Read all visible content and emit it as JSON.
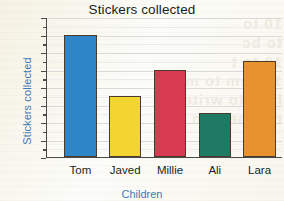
{
  "chart_data": {
    "type": "bar",
    "title": "Stickers collected",
    "xlabel": "Children",
    "ylabel": "Stickers collected",
    "categories": [
      "Tom",
      "Javed",
      "Millie",
      "Ali",
      "Lara"
    ],
    "values": [
      70,
      35,
      50,
      25,
      55
    ],
    "bar_colors": [
      "#2E86C8",
      "#F2D530",
      "#D63B52",
      "#1F7A63",
      "#E8922E"
    ],
    "ylim": [
      0,
      80
    ],
    "ytick_step": 10,
    "yminor_step": 5,
    "yticks": [
      0,
      10,
      20,
      30,
      40,
      50,
      60,
      70,
      80
    ],
    "ytick_labels": [
      "0",
      "10",
      "20",
      "30",
      "40",
      "50",
      "60",
      "70",
      "80"
    ],
    "grid": true,
    "legend": false,
    "legend_position": "none",
    "series": [
      {
        "name": "Stickers collected",
        "values": [
          70,
          35,
          50,
          25,
          55
        ]
      }
    ]
  },
  "style": {
    "title_color": "#1d1d1b",
    "axis_label_color": "#3f78b5",
    "tick_label_color": "#1d1d1b",
    "axis_line_color": "#4a4a4a",
    "gridline_color": "#d9d9d9",
    "bar_outline_color": "#4b3b2a",
    "background_color": "#fbfbf7"
  },
  "background_bleed_text": "10 to\nto bc\n10 to t\n102 cm to m\nhow to write\nnumbers in or"
}
